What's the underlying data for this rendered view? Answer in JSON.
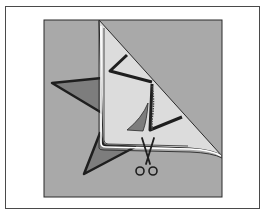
{
  "figure": {
    "colors": {
      "frame_border": "#4a4a4a",
      "background_fabric": "#a9a9a9",
      "star_fill": "#7d7d7d",
      "folded_flap": "#dcdcdc",
      "outline": "#1e1e1e",
      "paper": "#ffffff"
    },
    "icons": [
      "scissors-icon"
    ],
    "caption": ""
  }
}
